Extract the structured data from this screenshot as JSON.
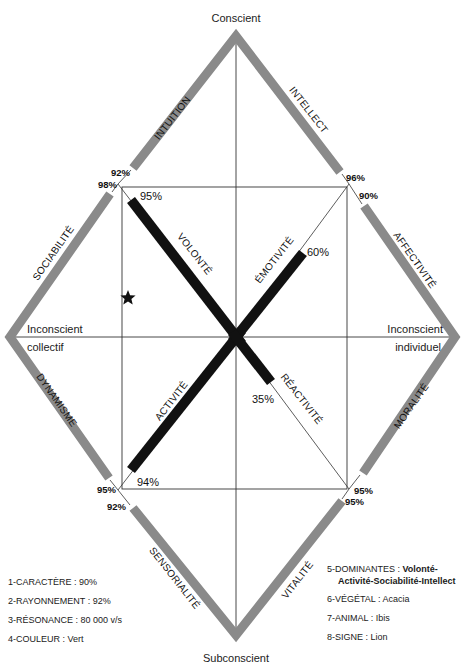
{
  "diagram": {
    "poles": {
      "top": "Conscient",
      "bottom": "Subconscient",
      "left_line1": "Inconscient",
      "left_line2": "collectif",
      "right_line1": "Inconscient",
      "right_line2": "individuel"
    },
    "outer_axes": [
      {
        "name": "INTUITION",
        "value": "92%"
      },
      {
        "name": "INTELLECT",
        "value": "96%"
      },
      {
        "name": "SOCIABILITÉ",
        "value": "98%"
      },
      {
        "name": "AFFECTIVITÉ",
        "value": "90%"
      },
      {
        "name": "DYNAMISME",
        "value": "95%"
      },
      {
        "name": "MORALITÉ",
        "value": "95%"
      },
      {
        "name": "SENSORIALITÉ",
        "value": "92%"
      },
      {
        "name": "VITALITÉ",
        "value": "95%"
      }
    ],
    "inner_axes": [
      {
        "name": "VOLONTÉ",
        "value": "95%"
      },
      {
        "name": "ÉMOTIVITÉ",
        "value": "60%"
      },
      {
        "name": "ACTIVITÉ",
        "value": "94%"
      },
      {
        "name": "RÉACTIVITÉ",
        "value": "35%"
      }
    ],
    "marker": "star-icon"
  },
  "legend_left": [
    {
      "key": "1-CARACTÈRE",
      "value": "90%"
    },
    {
      "key": "2-RAYONNEMENT",
      "value": "92%"
    },
    {
      "key": "3-RÉSONANCE",
      "value": "80 000 v/s"
    },
    {
      "key": "4-COULEUR",
      "value": "Vert"
    }
  ],
  "legend_right": [
    {
      "key": "5-DOMINANTES",
      "value": "Volonté-",
      "value_cont": "Activité-Sociabilité-Intellect"
    },
    {
      "key": "6-VÉGÉTAL",
      "value": "Acacia"
    },
    {
      "key": "7-ANIMAL",
      "value": "Ibis"
    },
    {
      "key": "8-SIGNE",
      "value": "Lion"
    }
  ],
  "colors": {
    "gray_bar": "#8a8a8a",
    "black_bar": "#111111",
    "line": "#333333"
  }
}
